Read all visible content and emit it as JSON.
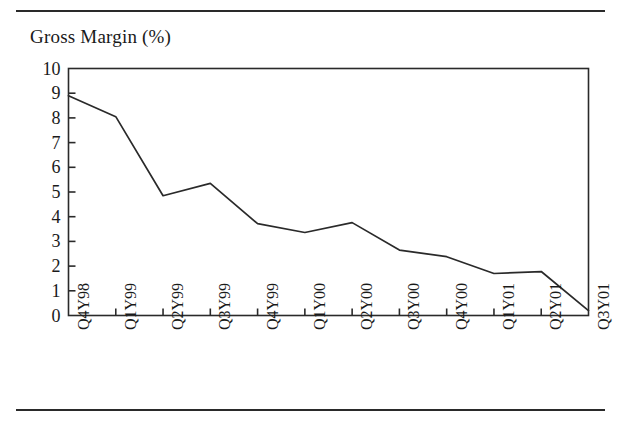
{
  "figure": {
    "title": "Gross Margin (%)",
    "has_top_rule": true,
    "has_bottom_rule": true,
    "line_color": "#2a2a2a",
    "frame_color": "#2a2a2a",
    "background": "#ffffff"
  },
  "chart_data": {
    "type": "line",
    "title": "Gross Margin (%)",
    "xlabel": "",
    "ylabel": "",
    "categories": [
      "Q4Y98",
      "Q1Y99",
      "Q2Y99",
      "Q3Y99",
      "Q4Y99",
      "Q1Y00",
      "Q2Y00",
      "Q3Y00",
      "Q4Y00",
      "Q1Y01",
      "Q2Y01",
      "Q3Y01"
    ],
    "values": [
      8.9,
      8.05,
      4.85,
      5.35,
      3.72,
      3.36,
      3.76,
      2.65,
      2.38,
      1.7,
      1.78,
      0.2
    ],
    "ylim": [
      0,
      10
    ],
    "ytick_labels": [
      "10",
      "9",
      "8",
      "7",
      "6",
      "5",
      "4",
      "3",
      "2",
      "1",
      "0"
    ],
    "ytick_values": [
      10,
      9,
      8,
      7,
      6,
      5,
      4,
      3,
      2,
      1,
      0
    ],
    "grid": false,
    "legend": false,
    "legend_position": "none",
    "xtick_rotation_degrees": 90,
    "series": [
      {
        "name": "Gross Margin (%)",
        "values": [
          8.9,
          8.05,
          4.85,
          5.35,
          3.72,
          3.36,
          3.76,
          2.65,
          2.38,
          1.7,
          1.78,
          0.2
        ]
      }
    ]
  }
}
